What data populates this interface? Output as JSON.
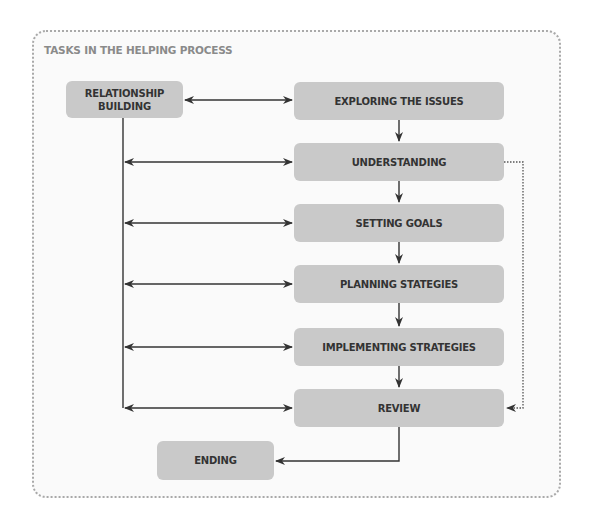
{
  "diagram": {
    "title": "TASKS IN THE HELPING PROCESS",
    "nodes": {
      "relationship": "RELATIONSHIP BUILDING",
      "relationship_line1": "RELATIONSHIP",
      "relationship_line2": "BUILDING",
      "exploring": "EXPLORING THE ISSUES",
      "understanding": "UNDERSTANDING",
      "setting_goals": "SETTING GOALS",
      "planning": "PLANNING STATEGIES",
      "implementing": "IMPLEMENTING STRATEGIES",
      "review": "REVIEW",
      "ending": "ENDING"
    },
    "edges": [
      {
        "from": "relationship",
        "to": "exploring",
        "type": "bidirectional"
      },
      {
        "from": "exploring",
        "to": "understanding",
        "type": "arrow"
      },
      {
        "from": "understanding",
        "to": "setting_goals",
        "type": "arrow"
      },
      {
        "from": "setting_goals",
        "to": "planning",
        "type": "arrow"
      },
      {
        "from": "planning",
        "to": "implementing",
        "type": "arrow"
      },
      {
        "from": "implementing",
        "to": "review",
        "type": "arrow"
      },
      {
        "from": "relationship",
        "to": "understanding",
        "type": "bidirectional"
      },
      {
        "from": "relationship",
        "to": "setting_goals",
        "type": "bidirectional"
      },
      {
        "from": "relationship",
        "to": "planning",
        "type": "bidirectional"
      },
      {
        "from": "relationship",
        "to": "implementing",
        "type": "bidirectional"
      },
      {
        "from": "relationship",
        "to": "review",
        "type": "bidirectional"
      },
      {
        "from": "understanding",
        "to": "review",
        "type": "dotted-arrow"
      },
      {
        "from": "review",
        "to": "ending",
        "type": "arrow"
      }
    ],
    "colors": {
      "box_fill": "#c9c9c9",
      "box_text": "#333333",
      "title_text": "#8a8a8a",
      "frame_border": "#a9a9a9",
      "line": "#333333"
    }
  }
}
